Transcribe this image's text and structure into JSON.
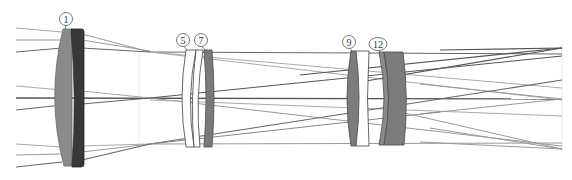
{
  "diagram": {
    "type": "optical-ray-trace",
    "colors": {
      "background": "#ffffff",
      "lens_light_gray": "#8a8a8a",
      "lens_dark": "#3a3a3a",
      "lens_mid_gray": "#7c7c7c",
      "lens_white": "#ffffff",
      "lens_outline": "#555555",
      "ray_dark": "#555555",
      "ray_light": "#a0a0a0"
    },
    "labels": [
      {
        "id": "1",
        "text": "1",
        "x": 66,
        "y": 19
      },
      {
        "id": "5",
        "text": "5",
        "x": 183,
        "y": 40
      },
      {
        "id": "7",
        "text": "7",
        "x": 201,
        "y": 40
      },
      {
        "id": "9",
        "text": "9",
        "x": 349,
        "y": 42
      },
      {
        "id": "12",
        "text": "12",
        "x": 378,
        "y": 44
      }
    ],
    "focal_points": [
      {
        "name": "top",
        "x": 562,
        "y": 48
      },
      {
        "name": "middle",
        "x": 562,
        "y": 99
      },
      {
        "name": "bottom",
        "x": 562,
        "y": 149
      }
    ],
    "image_plane_x": 562
  }
}
